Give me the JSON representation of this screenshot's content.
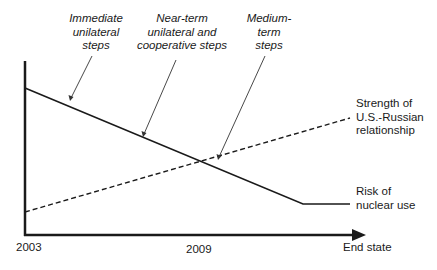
{
  "diagram": {
    "phase_labels": [
      {
        "lines": [
          "Immediate",
          "unilateral",
          "steps"
        ]
      },
      {
        "lines": [
          "Near-term",
          "unilateral and",
          "cooperative steps"
        ]
      },
      {
        "lines": [
          "Medium-",
          "term",
          "steps"
        ]
      }
    ],
    "series_labels": {
      "relationship": {
        "lines": [
          "Strength of",
          "U.S.-Russian",
          "relationship"
        ]
      },
      "risk": {
        "lines": [
          "Risk of",
          "nuclear use"
        ]
      }
    },
    "x_axis": {
      "ticks": [
        "2003",
        "2009"
      ],
      "end_label": "End state"
    },
    "colors": {
      "line": "#1a1a1a",
      "background": "#ffffff"
    }
  }
}
